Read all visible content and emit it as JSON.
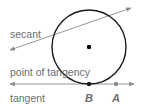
{
  "diagram": {
    "colors": {
      "circle": "#1a1a1a",
      "lines": "#8a8b8d",
      "label_text": "#6d6e71",
      "center_dot": "#000000",
      "point_A": "#8a8b8d",
      "point_B": "#1a1a1a"
    },
    "circle": {
      "cx": 89,
      "cy": 47,
      "r": 37
    },
    "center": {
      "cx": 89,
      "cy": 47
    },
    "secant": {
      "label": "secant",
      "x1": 10,
      "y1": 50,
      "x2": 131,
      "y2": 8
    },
    "tangent": {
      "label": "tangent",
      "x1": 10,
      "y1": 84,
      "x2": 134,
      "y2": 84
    },
    "point_of_tangency_label": "point of tangency",
    "points": [
      {
        "name": "B",
        "cx": 89,
        "cy": 84
      },
      {
        "name": "A",
        "cx": 116,
        "cy": 84
      }
    ]
  }
}
